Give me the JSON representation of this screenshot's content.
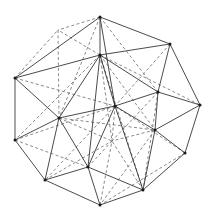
{
  "figure": {
    "name": "polyhedron-wireframe",
    "background_color": "#ffffff",
    "solid_edge_color": "#2b2b2b",
    "dashed_edge_color": "#6b6b6b",
    "vertex_color": "#1a1a1a",
    "solid_edge_width": 0.85,
    "dashed_edge_width": 0.8,
    "dash_pattern": "3 2.4",
    "vertex_radius": 1.5,
    "width": 215,
    "height": 223
  },
  "chart_data": {
    "type": "scatter",
    "title": "",
    "xlabel": "",
    "ylabel": "",
    "xlim": [
      0,
      215
    ],
    "ylim": [
      0,
      223
    ],
    "grid": false,
    "legend": "none",
    "vertices": [
      {
        "id": "v0",
        "label": "top",
        "x": 100,
        "y": 17,
        "visible_dot": true
      },
      {
        "id": "v1",
        "label": "upper-hub",
        "x": 100,
        "y": 55,
        "visible_dot": true
      },
      {
        "id": "v2",
        "label": "top-right",
        "x": 170,
        "y": 44,
        "visible_dot": true
      },
      {
        "id": "v3",
        "label": "left-upper",
        "x": 15,
        "y": 78,
        "visible_dot": true
      },
      {
        "id": "v4",
        "label": "hidden-upper-left",
        "x": 58,
        "y": 30,
        "visible_dot": false
      },
      {
        "id": "v5",
        "label": "right-upper-mid",
        "x": 158,
        "y": 92,
        "visible_dot": true
      },
      {
        "id": "v6",
        "label": "far-right",
        "x": 200,
        "y": 105,
        "visible_dot": true
      },
      {
        "id": "v7",
        "label": "center-hub",
        "x": 115,
        "y": 106,
        "visible_dot": true
      },
      {
        "id": "v8",
        "label": "left-mid",
        "x": 59,
        "y": 118,
        "visible_dot": true
      },
      {
        "id": "v9",
        "label": "left-lower",
        "x": 15,
        "y": 140,
        "visible_dot": true
      },
      {
        "id": "v10",
        "label": "right-lower-mid",
        "x": 155,
        "y": 130,
        "visible_dot": true
      },
      {
        "id": "v11",
        "label": "right-lower",
        "x": 185,
        "y": 153,
        "visible_dot": true
      },
      {
        "id": "v12",
        "label": "inner-lower",
        "x": 88,
        "y": 167,
        "visible_dot": true
      },
      {
        "id": "v13",
        "label": "bottom-left",
        "x": 45,
        "y": 180,
        "visible_dot": true
      },
      {
        "id": "v14",
        "label": "bottom-right-hub",
        "x": 143,
        "y": 190,
        "visible_dot": true
      },
      {
        "id": "v15",
        "label": "bottom",
        "x": 100,
        "y": 205,
        "visible_dot": true
      },
      {
        "id": "v16",
        "label": "inner-center-low",
        "x": 112,
        "y": 141,
        "visible_dot": false
      }
    ],
    "edges_solid": [
      [
        "v0",
        "v1"
      ],
      [
        "v0",
        "v2"
      ],
      [
        "v0",
        "v3"
      ],
      [
        "v0",
        "v7"
      ],
      [
        "v1",
        "v2"
      ],
      [
        "v1",
        "v3"
      ],
      [
        "v1",
        "v7"
      ],
      [
        "v1",
        "v8"
      ],
      [
        "v1",
        "v5"
      ],
      [
        "v1",
        "v12"
      ],
      [
        "v2",
        "v5"
      ],
      [
        "v2",
        "v6"
      ],
      [
        "v3",
        "v8"
      ],
      [
        "v3",
        "v9"
      ],
      [
        "v5",
        "v6"
      ],
      [
        "v5",
        "v7"
      ],
      [
        "v5",
        "v10"
      ],
      [
        "v6",
        "v10"
      ],
      [
        "v6",
        "v11"
      ],
      [
        "v7",
        "v8"
      ],
      [
        "v7",
        "v10"
      ],
      [
        "v7",
        "v12"
      ],
      [
        "v7",
        "v14"
      ],
      [
        "v8",
        "v9"
      ],
      [
        "v8",
        "v12"
      ],
      [
        "v8",
        "v13"
      ],
      [
        "v9",
        "v13"
      ],
      [
        "v10",
        "v11"
      ],
      [
        "v10",
        "v14"
      ],
      [
        "v11",
        "v14"
      ],
      [
        "v12",
        "v13"
      ],
      [
        "v12",
        "v14"
      ],
      [
        "v12",
        "v15"
      ],
      [
        "v13",
        "v15"
      ],
      [
        "v14",
        "v15"
      ]
    ],
    "edges_dashed": [
      [
        "v0",
        "v4"
      ],
      [
        "v0",
        "v5"
      ],
      [
        "v0",
        "v8"
      ],
      [
        "v1",
        "v4"
      ],
      [
        "v1",
        "v6"
      ],
      [
        "v1",
        "v9"
      ],
      [
        "v1",
        "v10"
      ],
      [
        "v1",
        "v14"
      ],
      [
        "v1",
        "v16"
      ],
      [
        "v2",
        "v7"
      ],
      [
        "v3",
        "v4"
      ],
      [
        "v3",
        "v7"
      ],
      [
        "v4",
        "v8"
      ],
      [
        "v5",
        "v16"
      ],
      [
        "v5",
        "v14"
      ],
      [
        "v7",
        "v9"
      ],
      [
        "v7",
        "v13"
      ],
      [
        "v7",
        "v16"
      ],
      [
        "v7",
        "v11"
      ],
      [
        "v8",
        "v16"
      ],
      [
        "v8",
        "v10"
      ],
      [
        "v9",
        "v12"
      ],
      [
        "v10",
        "v16"
      ],
      [
        "v10",
        "v15"
      ],
      [
        "v12",
        "v16"
      ],
      [
        "v13",
        "v16"
      ],
      [
        "v14",
        "v16"
      ],
      [
        "v15",
        "v16"
      ],
      [
        "v11",
        "v15"
      ]
    ]
  }
}
